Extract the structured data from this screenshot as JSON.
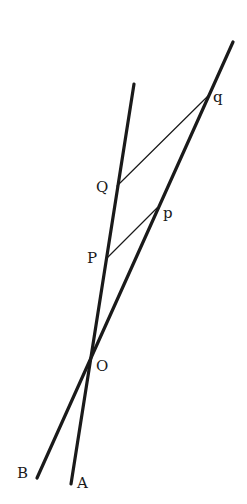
{
  "diagram": {
    "type": "geometry-construction",
    "background": "#ffffff",
    "ink_color": "#1a1a1a",
    "lines": [
      {
        "id": "line-A",
        "label": "A",
        "from": [
          134,
          84
        ],
        "to": [
          71,
          484
        ],
        "weight": "thick"
      },
      {
        "id": "line-B",
        "label": "B",
        "from": [
          233,
          42
        ],
        "to": [
          37,
          478
        ],
        "weight": "thick"
      },
      {
        "id": "segment-Qq",
        "from": [
          117,
          186
        ],
        "to": [
          208,
          96
        ],
        "weight": "thin"
      },
      {
        "id": "segment-Pp",
        "from": [
          107,
          258
        ],
        "to": [
          157,
          208
        ],
        "weight": "thin"
      }
    ],
    "points": [
      {
        "name": "q",
        "at": [
          208,
          96
        ],
        "label_pos": [
          213,
          102
        ]
      },
      {
        "name": "Q",
        "at": [
          117,
          186
        ],
        "label_pos": [
          96,
          192
        ]
      },
      {
        "name": "p",
        "at": [
          157,
          208
        ],
        "label_pos": [
          163,
          218
        ]
      },
      {
        "name": "P",
        "at": [
          107,
          258
        ],
        "label_pos": [
          87,
          263
        ]
      },
      {
        "name": "O",
        "at": [
          94,
          360
        ],
        "label_pos": [
          96,
          371
        ]
      },
      {
        "name": "B",
        "at": [
          37,
          478
        ],
        "label_pos": [
          17,
          478
        ]
      },
      {
        "name": "A",
        "at": [
          71,
          484
        ],
        "label_pos": [
          77,
          488
        ]
      }
    ],
    "labels": {
      "q": "q",
      "Q": "Q",
      "p": "p",
      "P": "P",
      "O": "O",
      "B": "B",
      "A": "A"
    }
  }
}
